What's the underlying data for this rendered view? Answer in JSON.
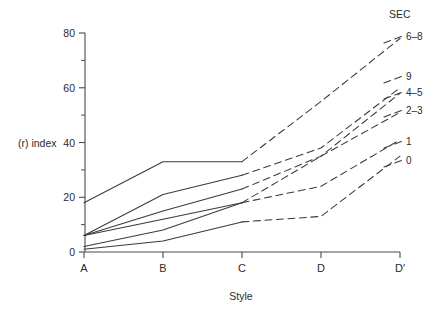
{
  "chart_data": {
    "type": "line",
    "title": "",
    "xlabel": "Style",
    "ylabel": "(r) index",
    "categories": [
      "A",
      "B",
      "C",
      "D",
      "D'"
    ],
    "x_tick_labels": [
      "A",
      "B",
      "C",
      "D",
      "D'"
    ],
    "y_tick_labels": [
      "0",
      "20",
      "40",
      "60",
      "80"
    ],
    "y_ticks": [
      0,
      20,
      40,
      60,
      80
    ],
    "y_minor_ticks": [
      10,
      30,
      50,
      70
    ],
    "ylim": [
      0,
      80
    ],
    "grid": false,
    "legend_position": "right",
    "legend_title": "SEC",
    "series": [
      {
        "name": "6-8",
        "label": "6–8",
        "values": [
          18,
          33,
          33,
          55,
          78
        ],
        "solid_through": "C",
        "dash_from": "C"
      },
      {
        "name": "9",
        "label": "9",
        "values": [
          6,
          21,
          28,
          38,
          60
        ],
        "solid_through": "C",
        "dash_from": "C"
      },
      {
        "name": "4-5",
        "label": "4–5",
        "values": [
          6,
          15,
          23,
          35,
          58
        ],
        "solid_through": "C",
        "dash_from": "C"
      },
      {
        "name": "2-3",
        "label": "2–3",
        "values": [
          6,
          12,
          18,
          35,
          51
        ],
        "solid_through": "C",
        "dash_from": "C"
      },
      {
        "name": "1",
        "label": "1",
        "values": [
          2,
          8,
          18,
          24,
          41
        ],
        "solid_through": "C",
        "dash_from": "C"
      },
      {
        "name": "0",
        "label": "0",
        "values": [
          1,
          4,
          11,
          13,
          35
        ],
        "solid_through": "C",
        "dash_from": "C"
      }
    ]
  },
  "axes": {
    "y_axis_title": "(r) index",
    "x_axis_title": "Style",
    "y_labels": {
      "t0": "0",
      "t20": "20",
      "t40": "40",
      "t60": "60",
      "t80": "80"
    },
    "x_labels": {
      "a": "A",
      "b": "B",
      "c": "C",
      "d": "D",
      "dprime": "D′"
    }
  },
  "legend": {
    "header": "SEC",
    "items": [
      {
        "label": "6–8"
      },
      {
        "label": "9"
      },
      {
        "label": "4–5"
      },
      {
        "label": "2–3"
      },
      {
        "label": "1"
      },
      {
        "label": "0"
      }
    ]
  },
  "colors": {
    "line": "#3a3a3a",
    "axis": "#4a4a4a",
    "text": "#2b2b2b",
    "background": "#ffffff"
  }
}
